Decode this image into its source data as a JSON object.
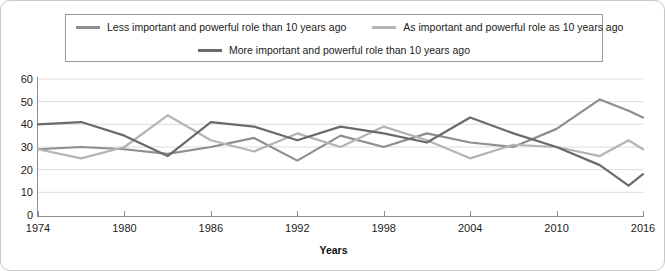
{
  "chart_data": {
    "type": "line",
    "title": "",
    "xlabel": "Years",
    "ylabel": "",
    "xlim": [
      1974,
      2016
    ],
    "ylim": [
      0,
      60
    ],
    "grid": true,
    "legend_position": "top",
    "y_ticks": [
      0,
      10,
      20,
      30,
      40,
      50,
      60
    ],
    "x_ticks": [
      1974,
      1980,
      1986,
      1992,
      1998,
      2004,
      2010,
      2016
    ],
    "x": [
      1974,
      1977,
      1980,
      1983,
      1986,
      1989,
      1992,
      1995,
      1998,
      2001,
      2004,
      2007,
      2010,
      2013,
      2015,
      2016
    ],
    "series": [
      {
        "name": "Less important and powerful role than 10 years ago",
        "color": "#8e8e8e",
        "values": [
          29,
          30,
          29,
          27,
          30,
          34,
          24,
          35,
          30,
          36,
          32,
          30,
          38,
          51,
          46,
          43
        ]
      },
      {
        "name": "As important and powerful role as 10 years ago",
        "color": "#b4b4b4",
        "values": [
          29,
          25,
          30,
          44,
          33,
          28,
          36,
          30,
          39,
          33,
          25,
          31,
          30,
          26,
          33,
          29
        ]
      },
      {
        "name": "More important and powerful role than 10 years ago",
        "color": "#6a6a6a",
        "values": [
          40,
          41,
          35,
          26,
          41,
          39,
          33,
          39,
          36,
          32,
          43,
          36,
          30,
          22,
          13,
          18
        ]
      }
    ]
  },
  "legend": {
    "items": [
      {
        "label": "Less important and powerful role than 10 years ago",
        "color": "#8e8e8e"
      },
      {
        "label": "As important and powerful role as 10 years ago",
        "color": "#b4b4b4"
      },
      {
        "label": "More important and powerful role than 10 years ago",
        "color": "#6a6a6a"
      }
    ]
  },
  "axis": {
    "x_title": "Years",
    "y_tick_labels": [
      "60",
      "50",
      "40",
      "30",
      "20",
      "10",
      "0"
    ],
    "x_tick_labels": [
      "1974",
      "1980",
      "1986",
      "1992",
      "1998",
      "2004",
      "2010",
      "2016"
    ]
  }
}
